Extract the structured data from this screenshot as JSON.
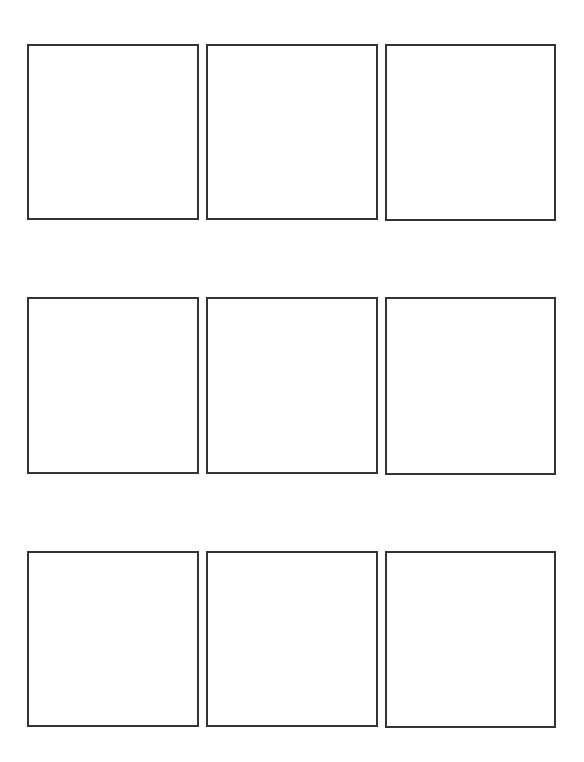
{
  "grid": {
    "rows": 3,
    "columns": 3,
    "border_color": "#333333",
    "background_color": "#ffffff",
    "panels": [
      {
        "row": 1,
        "col": 1,
        "x": 27,
        "y": 44,
        "w": 172,
        "h": 176,
        "content": ""
      },
      {
        "row": 1,
        "col": 2,
        "x": 206,
        "y": 44,
        "w": 172,
        "h": 176,
        "content": ""
      },
      {
        "row": 1,
        "col": 3,
        "x": 385,
        "y": 44,
        "w": 171,
        "h": 177,
        "content": ""
      },
      {
        "row": 2,
        "col": 1,
        "x": 27,
        "y": 297,
        "w": 172,
        "h": 177,
        "content": ""
      },
      {
        "row": 2,
        "col": 2,
        "x": 206,
        "y": 297,
        "w": 172,
        "h": 177,
        "content": ""
      },
      {
        "row": 2,
        "col": 3,
        "x": 385,
        "y": 297,
        "w": 171,
        "h": 178,
        "content": ""
      },
      {
        "row": 3,
        "col": 1,
        "x": 27,
        "y": 551,
        "w": 172,
        "h": 176,
        "content": ""
      },
      {
        "row": 3,
        "col": 2,
        "x": 206,
        "y": 551,
        "w": 172,
        "h": 176,
        "content": ""
      },
      {
        "row": 3,
        "col": 3,
        "x": 385,
        "y": 551,
        "w": 171,
        "h": 177,
        "content": ""
      }
    ]
  }
}
